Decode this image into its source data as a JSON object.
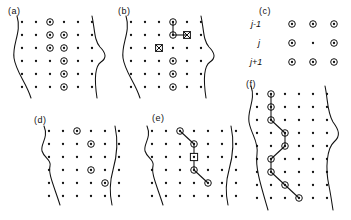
{
  "figure": {
    "title": "",
    "kind": "scientific-diagram",
    "width": 351,
    "height": 220,
    "background": "#ffffff",
    "ink": "#111111"
  },
  "legend_symbols": {
    "plain_dot": "plain-grid-node",
    "circled_dot": "selected-node",
    "crossed_square": "rejected-node",
    "open_square": "anchor-node",
    "chain_link": "connection-segment",
    "boundary_curve": "object-boundary"
  },
  "panels": [
    {
      "id": "a",
      "label": "(a)",
      "label_x": 8,
      "label_y": 14,
      "grid": {
        "cols": 6,
        "rows": 6,
        "x0": 22,
        "y0": 22,
        "dx": 14,
        "dy": 13
      },
      "curves": [
        "M 17 16 C 22 32, 12 44, 14 58 C 16 72, 26 82, 31 98",
        "M 92 16 C 95 30, 94 40, 100 47 C 106 53, 107 58, 101 62 C 95 66, 94 78, 97 98"
      ],
      "selected": [
        [
          2,
          0
        ],
        [
          2,
          1
        ],
        [
          3,
          1
        ],
        [
          2,
          2
        ],
        [
          3,
          2
        ],
        [
          3,
          3
        ],
        [
          3,
          4
        ],
        [
          3,
          5
        ]
      ],
      "crossed": [],
      "squares": [],
      "chain": []
    },
    {
      "id": "b",
      "label": "(b)",
      "label_x": 118,
      "label_y": 14,
      "grid": {
        "cols": 6,
        "rows": 6,
        "x0": 131,
        "y0": 22,
        "dx": 14,
        "dy": 13
      },
      "curves": [
        "M 126 16 C 131 32, 121 44, 123 58 C 125 72, 135 82, 140 98",
        "M 201 16 C 204 30, 203 40, 209 47 C 215 53, 216 58, 210 62 C 204 66, 203 78, 206 98"
      ],
      "selected": [
        [
          3,
          0
        ],
        [
          3,
          1
        ],
        [
          3,
          3
        ],
        [
          3,
          4
        ],
        [
          3,
          5
        ]
      ],
      "crossed": [
        [
          4,
          1
        ],
        [
          2,
          2
        ]
      ],
      "squares": [],
      "chain": [
        [
          3,
          0
        ],
        [
          3,
          1
        ],
        [
          4,
          1
        ]
      ]
    },
    {
      "id": "c",
      "label": "(c)",
      "label_x": 259,
      "label_y": 14,
      "grid": {
        "cols": 3,
        "rows": 3,
        "x0": 292,
        "y0": 24,
        "dx": 21,
        "dy": 19
      },
      "curves": [],
      "selected": [
        [
          0,
          0
        ],
        [
          1,
          0
        ],
        [
          2,
          0
        ],
        [
          0,
          1
        ],
        [
          2,
          1
        ],
        [
          0,
          2
        ],
        [
          1,
          2
        ],
        [
          2,
          2
        ]
      ],
      "crossed": [],
      "squares": [],
      "chain": [],
      "row_labels": [
        {
          "text": "j-1",
          "x": 251,
          "y": 27
        },
        {
          "text": "j",
          "x": 258,
          "y": 46
        },
        {
          "text": "j+1",
          "x": 250,
          "y": 65
        }
      ]
    },
    {
      "id": "d",
      "label": "(d)",
      "label_x": 34,
      "label_y": 123,
      "grid": {
        "cols": 6,
        "rows": 6,
        "x0": 49,
        "y0": 131,
        "dx": 14,
        "dy": 13
      },
      "curves": [
        "M 44 126 C 49 138, 40 144, 42 151 C 44 158, 52 160, 50 166 C 48 174, 54 186, 60 205",
        "M 115 126 C 118 140, 117 156, 113 170 C 109 184, 110 196, 112 205"
      ],
      "selected": [
        [
          2,
          0
        ],
        [
          3,
          1
        ],
        [
          3,
          3
        ],
        [
          4,
          4
        ]
      ],
      "crossed": [],
      "squares": [],
      "chain": []
    },
    {
      "id": "e",
      "label": "(e)",
      "label_x": 152,
      "label_y": 121,
      "grid": {
        "cols": 7,
        "rows": 6,
        "x0": 152,
        "y0": 131,
        "dx": 14,
        "dy": 13
      },
      "curves": [
        "M 147 126 C 152 138, 143 144, 145 151 C 147 158, 155 160, 153 166 C 151 174, 157 186, 163 205",
        "M 231 126 C 234 140, 233 156, 229 170 C 225 184, 226 196, 228 205"
      ],
      "selected": [
        [
          2,
          0
        ],
        [
          3,
          1
        ],
        [
          3,
          3
        ],
        [
          4,
          4
        ]
      ],
      "crossed": [],
      "squares": [
        [
          3,
          2
        ]
      ],
      "chain": [
        [
          2,
          0
        ],
        [
          3,
          1
        ],
        [
          3,
          2
        ],
        [
          3,
          3
        ],
        [
          4,
          4
        ]
      ]
    },
    {
      "id": "f",
      "label": "(f)",
      "label_x": 246,
      "label_y": 87,
      "grid": {
        "cols": 6,
        "rows": 9,
        "x0": 257,
        "y0": 94,
        "dx": 14,
        "dy": 13
      },
      "curves": [
        "M 251 86 C 256 100, 247 110, 249 122 C 251 134, 259 142, 257 154 C 255 168, 261 186, 268 210",
        "M 325 86 C 328 100, 327 112, 333 122 C 339 130, 341 136, 334 142 C 327 148, 325 168, 329 186 C 331 196, 332 204, 333 210"
      ],
      "selected": [
        [
          1,
          0
        ],
        [
          1,
          1
        ],
        [
          1,
          2
        ],
        [
          2,
          3
        ],
        [
          2,
          4
        ],
        [
          1,
          5
        ],
        [
          1,
          6
        ],
        [
          2,
          7
        ],
        [
          3,
          8
        ]
      ],
      "crossed": [],
      "squares": [],
      "chain": [
        [
          1,
          0
        ],
        [
          1,
          1
        ],
        [
          1,
          2
        ],
        [
          2,
          3
        ],
        [
          2,
          4
        ],
        [
          1,
          5
        ],
        [
          1,
          6
        ],
        [
          2,
          7
        ],
        [
          3,
          8
        ]
      ]
    }
  ]
}
